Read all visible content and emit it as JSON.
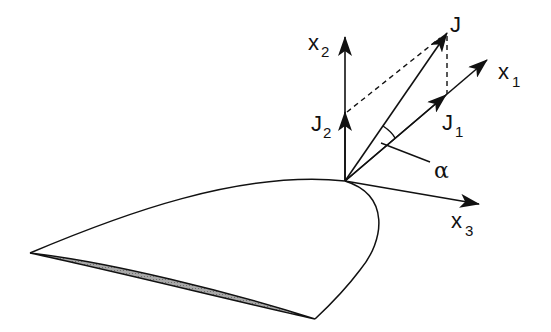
{
  "diagram": {
    "type": "vector-decomposition-on-airfoil",
    "labels": {
      "x1": {
        "base": "x",
        "sub": "1"
      },
      "x2": {
        "base": "x",
        "sub": "2"
      },
      "x3": {
        "base": "x",
        "sub": "3"
      },
      "J": {
        "base": "J",
        "sub": ""
      },
      "J1": {
        "base": "J",
        "sub": "1"
      },
      "J2": {
        "base": "J",
        "sub": "2"
      },
      "alpha": "α"
    },
    "colors": {
      "stroke": "#111111",
      "shading": "#9a9a9a",
      "background": "#ffffff"
    }
  }
}
